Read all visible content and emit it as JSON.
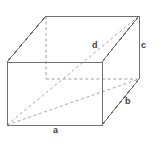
{
  "figure": {
    "background_color": "#ffffff",
    "edge_color": "#6e7072",
    "hidden_edge_color": "#9a9c9e",
    "label_color": "#3d3f41",
    "labels": {
      "a": "a",
      "b": "b",
      "c": "c",
      "d": "d"
    },
    "geometry": {
      "front_top_left": [
        7,
        62
      ],
      "front_top_right": [
        102,
        62
      ],
      "front_bottom_right": [
        102,
        125
      ],
      "front_bottom_left": [
        7,
        125
      ],
      "back_top_left": [
        46,
        16
      ],
      "back_top_right": [
        139,
        16
      ],
      "back_bottom_right": [
        139,
        79
      ],
      "back_bottom_left": [
        46,
        79
      ],
      "depth_offset": [
        39,
        -46
      ]
    },
    "edges_solid": [
      "front-top",
      "front-right",
      "front-bottom",
      "front-left",
      "back-top",
      "back-top-right-vertical",
      "top-left-connector",
      "top-right-connector",
      "right-bottom-connector"
    ],
    "edges_hidden": [
      "back-left-vertical",
      "back-bottom"
    ],
    "diagonals_hidden": [
      "space-diagonal-d",
      "base-diagonal"
    ]
  }
}
